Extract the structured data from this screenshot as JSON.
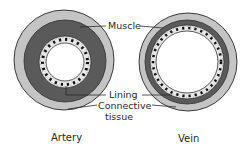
{
  "diagram": {
    "labels": {
      "muscle": "Muscle",
      "lining": "Lining",
      "connective_1": "Connective",
      "connective_2": "tissue"
    },
    "captions": {
      "artery": "Artery",
      "vein": "Vein"
    },
    "colors": {
      "connective": "#c4c4c4",
      "muscle": "#5a5a5a",
      "lining": "#e6e6e6",
      "lining_dots": "#111111",
      "lumen": "#ffffff",
      "outline": "#3a3a3a"
    }
  }
}
